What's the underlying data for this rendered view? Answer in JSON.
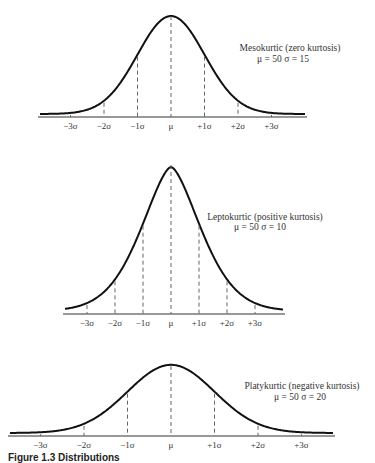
{
  "chart_data": [
    {
      "type": "line",
      "name": "mesokurtic",
      "title": "Mesokurtic (zero kurtosis)",
      "subtitle": "μ = 50  σ = 15",
      "mu": 50,
      "sigma": 15,
      "tick_labels": [
        "−3σ",
        "−2σ",
        "−1σ",
        "μ",
        "+1σ",
        "+2σ",
        "+3σ"
      ],
      "layout": {
        "baseline_y": 117,
        "mu_x": 171,
        "sigma_px": 33.5,
        "peak_y": 15,
        "x_start": 40,
        "x_end": 305,
        "shape_power": 2.0
      },
      "grid": false,
      "legend": "annotation right of peak"
    },
    {
      "type": "line",
      "name": "leptokurtic",
      "title": "Leptokurtic (positive kurtosis)",
      "subtitle": "μ = 50  σ = 10",
      "mu": 50,
      "sigma": 10,
      "tick_labels": [
        "−3σ",
        "−2σ",
        "−1σ",
        "μ",
        "+1σ",
        "+2σ",
        "+3σ"
      ],
      "layout": {
        "baseline_y": 314,
        "mu_x": 171,
        "sigma_px": 28,
        "peak_y": 164,
        "x_start": 65,
        "x_end": 283,
        "shape_power": 1.6
      },
      "grid": false,
      "legend": "annotation right of peak"
    },
    {
      "type": "line",
      "name": "platykurtic",
      "title": "Platykurtic (negative kurtosis)",
      "subtitle": "μ = 50  σ = 20",
      "mu": 50,
      "sigma": 20,
      "tick_labels": [
        "−3σ",
        "−2σ",
        "−1σ",
        "μ",
        "+1σ",
        "+2σ",
        "+3σ"
      ],
      "layout": {
        "baseline_y": 436,
        "mu_x": 171,
        "sigma_px": 43.5,
        "peak_y": 365,
        "x_start": 10,
        "x_end": 333,
        "shape_power": 2.0
      },
      "grid": false,
      "legend": "annotation right of peak"
    }
  ],
  "annotations": {
    "meso_title": "Mesokurtic (zero kurtosis)",
    "meso_params": "μ = 50  σ = 15",
    "lepto_title": "Leptokurtic (positive kurtosis)",
    "lepto_params": "μ = 50  σ = 10",
    "platy_title": "Platykurtic (negative kurtosis)",
    "platy_params": "μ = 50  σ = 20"
  },
  "caption": "Figure 1.3 Distributions"
}
